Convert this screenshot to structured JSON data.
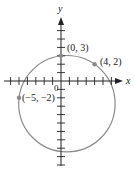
{
  "diagram": {
    "type": "coordinate-plane-circle",
    "axes": {
      "x_label": "x",
      "y_label": "y",
      "origin_label": "0",
      "x_range": [
        -6,
        6
      ],
      "y_range": [
        -8,
        7
      ],
      "tick_spacing": 1
    },
    "circle": {
      "center": [
        0.7,
        -2.7
      ],
      "radius": 5.74,
      "stroke": "#8a8a8a"
    },
    "points": [
      {
        "label": "(0, 3)",
        "x": 0,
        "y": 3
      },
      {
        "label": "(4, 2)",
        "x": 4,
        "y": 2
      },
      {
        "label": "(−5, −2)",
        "x": -5,
        "y": -2
      }
    ],
    "colors": {
      "axis": "#222222",
      "point": "#8a8a8a",
      "text": "#222222"
    }
  }
}
